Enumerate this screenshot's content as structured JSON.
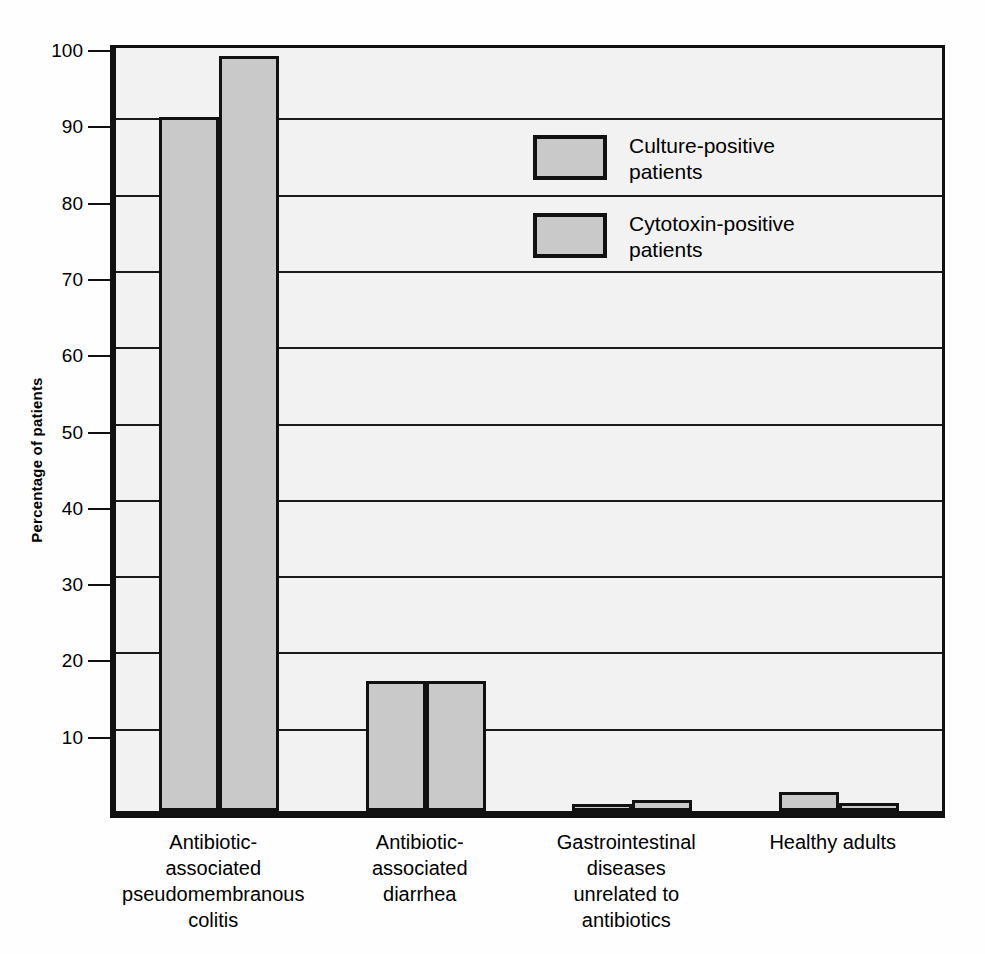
{
  "chart_data": {
    "type": "bar",
    "title": "",
    "xlabel": "",
    "ylabel": "Percentage of patients",
    "ylim": [
      0,
      100
    ],
    "ytick_values": [
      10,
      20,
      30,
      40,
      50,
      60,
      70,
      80,
      90,
      100
    ],
    "ytick_labels": [
      "10",
      "20",
      "30",
      "40",
      "50",
      "60",
      "70",
      "80",
      "90",
      "100"
    ],
    "grid": true,
    "grid_axis": "y",
    "legend_position": "upper-center-right",
    "categories": [
      "Antibiotic-\nassociated\npseudomembranous\ncolitis",
      "Antibiotic-\nassociated\ndiarrhea",
      "Gastrointestinal\ndiseases\nunrelated to\nantibiotics",
      "Healthy adults"
    ],
    "series": [
      {
        "name": "Culture-positive\npatients",
        "color": "#c9c9c9",
        "values": [
          91,
          17,
          0.5,
          2.5
        ]
      },
      {
        "name": "Cytotoxin-positive\npatients",
        "color": "#c9c9c9",
        "values": [
          99,
          17,
          1.5,
          1
        ]
      }
    ]
  },
  "style": {
    "bar_fill": "#c9c9c9",
    "bar_edge": "#111111",
    "plot_background": "#f2f2f2",
    "page_background": "#ffffff",
    "grid_color": "#1a1a1a"
  }
}
